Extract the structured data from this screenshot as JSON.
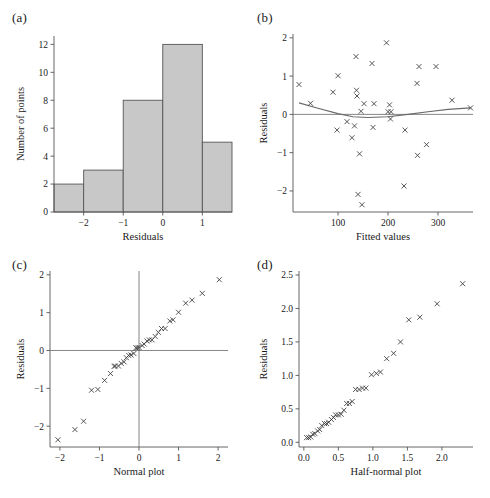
{
  "figure": {
    "background_color": "#ffffff",
    "bar_fill_color": "#c8c8c8",
    "marker_color": "#3a3a3a",
    "line_color": "#777777"
  },
  "panels": [
    {
      "id": "a",
      "label": "(a)"
    },
    {
      "id": "b",
      "label": "(b)"
    },
    {
      "id": "c",
      "label": "(c)"
    },
    {
      "id": "d",
      "label": "(d)"
    }
  ],
  "chart_data": [
    {
      "panel": "a",
      "type": "bar",
      "title": "",
      "xlabel": "Residuals",
      "ylabel": "Number of points",
      "xlim": [
        -2.75,
        1.75
      ],
      "ylim": [
        0,
        12.6
      ],
      "xticks": [
        -2,
        -1,
        0,
        1
      ],
      "xtick_labels": [
        "−2",
        "−1",
        "0",
        "1"
      ],
      "yticks": [
        0,
        2,
        4,
        6,
        8,
        10,
        12
      ],
      "ytick_labels": [
        "0",
        "2",
        "4",
        "6",
        "8",
        "10",
        "12"
      ],
      "grid": false,
      "bin_edges": [
        -2.75,
        -2,
        -1,
        0,
        1,
        1.75
      ],
      "categories": [
        "-2.75 to -2",
        "-2 to -1",
        "-1 to 0",
        "0 to 1",
        "1 to 1.75"
      ],
      "values": [
        2,
        3,
        8,
        12,
        5
      ]
    },
    {
      "panel": "b",
      "type": "scatter",
      "title": "",
      "xlabel": "Fitted values",
      "ylabel": "Residuals",
      "xlim": [
        10,
        370
      ],
      "ylim": [
        -2.55,
        2.1
      ],
      "xticks": [
        100,
        200,
        300
      ],
      "xtick_labels": [
        "100",
        "200",
        "300"
      ],
      "yticks": [
        -2,
        -1,
        0,
        1,
        2
      ],
      "ytick_labels": [
        "−2",
        "−1",
        "0",
        "1",
        "2"
      ],
      "grid": false,
      "marker": "x",
      "reference_line_y": 0,
      "smoother": {
        "description": "quadratic lowess-style smoother",
        "x": [
          22,
          60,
          100,
          130,
          160,
          200,
          240,
          280,
          320,
          365
        ],
        "y": [
          0.3,
          0.16,
          0.02,
          -0.06,
          -0.08,
          -0.06,
          0.0,
          0.07,
          0.13,
          0.17
        ]
      },
      "x": [
        22,
        45,
        90,
        98,
        100,
        118,
        128,
        133,
        136,
        137,
        138,
        140,
        143,
        146,
        148,
        152,
        168,
        170,
        172,
        197,
        200,
        203,
        205,
        206,
        232,
        234,
        258,
        259,
        262,
        277,
        296,
        328,
        365
      ],
      "y": [
        0.78,
        0.29,
        0.58,
        -0.41,
        1.01,
        -0.19,
        -0.61,
        -0.3,
        1.51,
        0.63,
        0.48,
        -2.09,
        -1.03,
        0.08,
        -2.36,
        0.28,
        1.33,
        -0.34,
        0.28,
        1.87,
        0.07,
        0.25,
        -0.12,
        0.07,
        -1.87,
        -0.41,
        0.81,
        -1.07,
        1.25,
        -0.79,
        1.25,
        0.37,
        0.17
      ]
    },
    {
      "panel": "c",
      "type": "scatter",
      "title": "",
      "xlabel": "Normal plot",
      "ylabel": "Residuals",
      "xlim": [
        -2.25,
        2.25
      ],
      "ylim": [
        -2.55,
        2.1
      ],
      "xticks": [
        -2,
        -1,
        0,
        1,
        2
      ],
      "xtick_labels": [
        "−2",
        "−1",
        "0",
        "1",
        "2"
      ],
      "yticks": [
        -2,
        -1,
        0,
        1,
        2
      ],
      "ytick_labels": [
        "−2",
        "−1",
        "0",
        "1",
        "2"
      ],
      "grid": false,
      "marker": "x",
      "reference_line_x": 0,
      "reference_line_y": 0,
      "x": [
        -2.05,
        -1.62,
        -1.4,
        -1.2,
        -1.04,
        -0.87,
        -0.72,
        -0.63,
        -0.6,
        -0.52,
        -0.45,
        -0.38,
        -0.32,
        -0.26,
        -0.2,
        -0.13,
        -0.08,
        -0.04,
        0.0,
        0.08,
        0.13,
        0.2,
        0.26,
        0.33,
        0.41,
        0.49,
        0.57,
        0.66,
        0.78,
        0.86,
        1.0,
        1.18,
        1.34,
        1.6,
        2.03
      ],
      "y": [
        -2.36,
        -2.09,
        -1.87,
        -1.05,
        -1.03,
        -0.79,
        -0.61,
        -0.42,
        -0.41,
        -0.41,
        -0.34,
        -0.3,
        -0.19,
        -0.13,
        -0.12,
        -0.08,
        0.07,
        0.07,
        0.08,
        0.13,
        0.17,
        0.25,
        0.28,
        0.28,
        0.37,
        0.48,
        0.58,
        0.58,
        0.78,
        0.81,
        1.01,
        1.25,
        1.33,
        1.51,
        1.87
      ]
    },
    {
      "panel": "d",
      "type": "scatter",
      "title": "",
      "xlabel": "Half-normal plot",
      "ylabel": "Residuals",
      "xlim": [
        -0.07,
        2.45
      ],
      "ylim": [
        -0.07,
        2.56
      ],
      "xticks": [
        0.0,
        0.5,
        1.0,
        1.5,
        2.0
      ],
      "xtick_labels": [
        "0.0",
        "0.5",
        "1.0",
        "1.5",
        "2.0"
      ],
      "yticks": [
        0.0,
        0.5,
        1.0,
        1.5,
        2.0,
        2.5
      ],
      "ytick_labels": [
        "0.0",
        "0.5",
        "1.0",
        "1.5",
        "2.0",
        "2.5"
      ],
      "grid": false,
      "marker": "x",
      "x": [
        0.04,
        0.07,
        0.1,
        0.13,
        0.16,
        0.2,
        0.23,
        0.26,
        0.3,
        0.33,
        0.36,
        0.4,
        0.43,
        0.46,
        0.5,
        0.54,
        0.58,
        0.62,
        0.66,
        0.7,
        0.75,
        0.8,
        0.85,
        0.9,
        0.98,
        1.05,
        1.11,
        1.2,
        1.3,
        1.4,
        1.52,
        1.68,
        1.93,
        2.3
      ],
      "y": [
        0.07,
        0.07,
        0.08,
        0.12,
        0.13,
        0.17,
        0.19,
        0.25,
        0.28,
        0.28,
        0.3,
        0.34,
        0.37,
        0.41,
        0.41,
        0.42,
        0.48,
        0.58,
        0.58,
        0.61,
        0.79,
        0.79,
        0.81,
        0.81,
        1.01,
        1.03,
        1.05,
        1.25,
        1.33,
        1.5,
        1.83,
        1.87,
        2.07,
        2.37
      ]
    }
  ]
}
